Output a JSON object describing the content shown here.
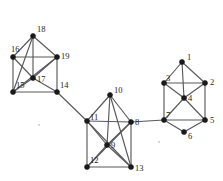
{
  "figure": {
    "title": "",
    "type": "undirected-graph-diagram",
    "width": 223,
    "height": 181,
    "background_color": "#ffffff",
    "node_color": "#1a1a1a",
    "edge_color": "#58595b",
    "label_color": "#231f20"
  },
  "graph": {
    "node_count": 19,
    "edge_count": 45,
    "nodes": [
      {
        "id": "1",
        "label": "1",
        "x": 182,
        "y": 62,
        "label_dx": 5,
        "label_dy": -9
      },
      {
        "id": "2",
        "label": "2",
        "x": 205,
        "y": 83,
        "label_dx": 5,
        "label_dy": -5
      },
      {
        "id": "3",
        "label": "3",
        "x": 164,
        "y": 83,
        "label_dx": 2,
        "label_dy": -9
      },
      {
        "id": "4",
        "label": "4",
        "x": 184,
        "y": 98,
        "label_dx": 4,
        "label_dy": -4
      },
      {
        "id": "5",
        "label": "5",
        "x": 205,
        "y": 120,
        "label_dx": 5,
        "label_dy": -4
      },
      {
        "id": "6",
        "label": "6",
        "x": 184,
        "y": 132,
        "label_dx": 4,
        "label_dy": 0
      },
      {
        "id": "7",
        "label": "7",
        "x": 164,
        "y": 120,
        "label_dx": 2,
        "label_dy": -9
      },
      {
        "id": "8",
        "label": "8",
        "x": 131,
        "y": 122,
        "label_dx": 4,
        "label_dy": -4
      },
      {
        "id": "9",
        "label": "9",
        "x": 107,
        "y": 145,
        "label_dx": 4,
        "label_dy": -4
      },
      {
        "id": "10",
        "label": "10",
        "x": 110,
        "y": 95,
        "label_dx": 4,
        "label_dy": -9
      },
      {
        "id": "11",
        "label": "11",
        "x": 87,
        "y": 121,
        "label_dx": 3,
        "label_dy": -8
      },
      {
        "id": "12",
        "label": "12",
        "x": 87,
        "y": 167,
        "label_dx": 3,
        "label_dy": -11
      },
      {
        "id": "13",
        "label": "13",
        "x": 131,
        "y": 167,
        "label_dx": 4,
        "label_dy": -3
      },
      {
        "id": "14",
        "label": "14",
        "x": 57,
        "y": 92,
        "label_dx": 3,
        "label_dy": -11
      },
      {
        "id": "15",
        "label": "15",
        "x": 13,
        "y": 92,
        "label_dx": 3,
        "label_dy": -11
      },
      {
        "id": "16",
        "label": "16",
        "x": 13,
        "y": 57,
        "label_dx": -2,
        "label_dy": -12
      },
      {
        "id": "17",
        "label": "17",
        "x": 33,
        "y": 78,
        "label_dx": 4,
        "label_dy": -3
      },
      {
        "id": "18",
        "label": "18",
        "x": 33,
        "y": 36,
        "label_dx": 4,
        "label_dy": -11
      },
      {
        "id": "19",
        "label": "19",
        "x": 57,
        "y": 57,
        "label_dx": 4,
        "label_dy": -5
      }
    ],
    "edges": [
      [
        "1",
        "3"
      ],
      [
        "1",
        "2"
      ],
      [
        "1",
        "4"
      ],
      [
        "2",
        "3"
      ],
      [
        "2",
        "4"
      ],
      [
        "2",
        "5"
      ],
      [
        "3",
        "4"
      ],
      [
        "3",
        "7"
      ],
      [
        "4",
        "5"
      ],
      [
        "4",
        "7"
      ],
      [
        "5",
        "6"
      ],
      [
        "5",
        "7"
      ],
      [
        "6",
        "7"
      ],
      [
        "7",
        "8"
      ],
      [
        "8",
        "10"
      ],
      [
        "8",
        "9"
      ],
      [
        "8",
        "11"
      ],
      [
        "8",
        "12"
      ],
      [
        "8",
        "13"
      ],
      [
        "9",
        "10"
      ],
      [
        "9",
        "11"
      ],
      [
        "9",
        "12"
      ],
      [
        "9",
        "13"
      ],
      [
        "10",
        "11"
      ],
      [
        "10",
        "13"
      ],
      [
        "11",
        "12"
      ],
      [
        "11",
        "13"
      ],
      [
        "11",
        "14"
      ],
      [
        "12",
        "13"
      ],
      [
        "14",
        "15"
      ],
      [
        "14",
        "17"
      ],
      [
        "14",
        "19"
      ],
      [
        "15",
        "16"
      ],
      [
        "15",
        "17"
      ],
      [
        "15",
        "18"
      ],
      [
        "15",
        "19"
      ],
      [
        "16",
        "17"
      ],
      [
        "16",
        "18"
      ],
      [
        "16",
        "19"
      ],
      [
        "17",
        "18"
      ],
      [
        "17",
        "19"
      ],
      [
        "18",
        "19"
      ]
    ],
    "clusters": [
      {
        "name": "left-cluster",
        "members": [
          "14",
          "15",
          "16",
          "17",
          "18",
          "19"
        ]
      },
      {
        "name": "middle-cluster",
        "members": [
          "8",
          "9",
          "10",
          "11",
          "12",
          "13"
        ]
      },
      {
        "name": "right-cluster",
        "members": [
          "1",
          "2",
          "3",
          "4",
          "5",
          "6",
          "7"
        ]
      }
    ],
    "bridges": [
      {
        "from": "14",
        "to": "11"
      },
      {
        "from": "8",
        "to": "7"
      }
    ]
  },
  "artifacts": [
    {
      "name": "speck-left",
      "x": 38,
      "y": 124
    },
    {
      "name": "speck-right",
      "x": 158,
      "y": 141
    }
  ]
}
